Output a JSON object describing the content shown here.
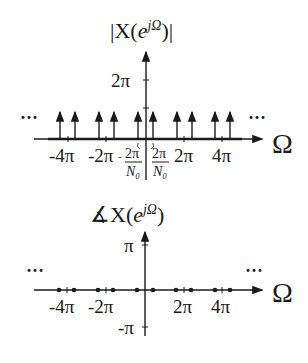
{
  "magnitude_plot": {
    "title": "|X(e^{jΩ})|",
    "title_parts": {
      "left": "|X(",
      "base": "e",
      "sup": "jΩ",
      "right": ")|"
    },
    "x_axis_label": "Ω",
    "y_tick_label": "2π",
    "x_tick_labels": [
      "-4π",
      "-2π",
      "-2π/N₀",
      "2π/N₀",
      "2π",
      "4π"
    ],
    "frac_label": {
      "num": "2π",
      "den": "N₀",
      "neg": "-"
    },
    "ellipsis_left": "···",
    "ellipsis_right": "···",
    "impulse_positions_px": [
      60,
      75,
      99,
      114,
      138,
      153,
      177,
      192,
      215,
      230
    ]
  },
  "phase_plot": {
    "title": "∡X(e^{jΩ})",
    "title_parts": {
      "left": "∡X(",
      "base": "e",
      "sup": "jΩ",
      "right": ")"
    },
    "x_axis_label": "Ω",
    "y_tick_labels": [
      "π",
      "-π"
    ],
    "x_tick_labels": [
      "-4π",
      "-2π",
      "2π",
      "4π"
    ],
    "ellipsis_left": "···",
    "ellipsis_right": "···",
    "dot_positions_px": [
      59,
      74,
      98,
      113,
      137,
      153,
      176,
      191,
      215,
      230
    ]
  }
}
